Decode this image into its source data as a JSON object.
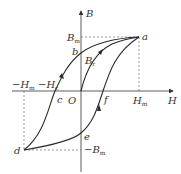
{
  "diagram": {
    "axes": {
      "x_label": "H",
      "y_label": "B",
      "origin_label": "O"
    },
    "labels": {
      "Bm": {
        "main": "B",
        "sub": "m"
      },
      "neg_Bm": {
        "main": "−B",
        "sub": "m"
      },
      "Hm": {
        "main": "H",
        "sub": "m"
      },
      "neg_Hm": {
        "main": "−H",
        "sub": "m"
      },
      "neg_Hc": {
        "main": "−H",
        "sub": "c"
      },
      "Br": {
        "main": "B",
        "sub": "r"
      },
      "a": "a",
      "b": "b",
      "c": "c",
      "d": "d",
      "e": "e",
      "f": "f"
    },
    "colors": {
      "curve": "#2a2a2a",
      "axis": "#333333",
      "dashed": "#555555"
    }
  }
}
